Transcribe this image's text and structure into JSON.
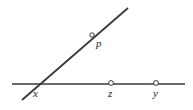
{
  "figure": {
    "background_color": "#ffffff",
    "stroke_color": "#3a3a3a",
    "label_color": "#1d1d1d",
    "width": 193,
    "height": 110,
    "horizontal_line": {
      "name": "horizontal-line",
      "x1": 12,
      "y1": 84,
      "x2": 185,
      "y2": 84
    },
    "diagonal_line": {
      "name": "diagonal-ray",
      "x1": 22,
      "y1": 100,
      "x2": 128,
      "y2": 8
    },
    "points": [
      {
        "id": "p",
        "label": "p",
        "marker_x": 92,
        "marker_y": 35,
        "marker_r": 2.2,
        "label_x": 96,
        "label_y": 38,
        "on": "diagonal-ray",
        "marker_visible": true
      },
      {
        "id": "x",
        "label": "x",
        "marker_x": 34,
        "marker_y": 84,
        "marker_r": 2.2,
        "label_x": 33,
        "label_y": 88,
        "on": "intersection",
        "marker_visible": false
      },
      {
        "id": "z",
        "label": "z",
        "marker_x": 111,
        "marker_y": 83,
        "marker_r": 2.4,
        "label_x": 108,
        "label_y": 88,
        "on": "horizontal-line",
        "marker_visible": true
      },
      {
        "id": "y",
        "label": "y",
        "marker_x": 156,
        "marker_y": 83,
        "marker_r": 2.4,
        "label_x": 153,
        "label_y": 88,
        "on": "horizontal-line",
        "marker_visible": true
      }
    ]
  }
}
